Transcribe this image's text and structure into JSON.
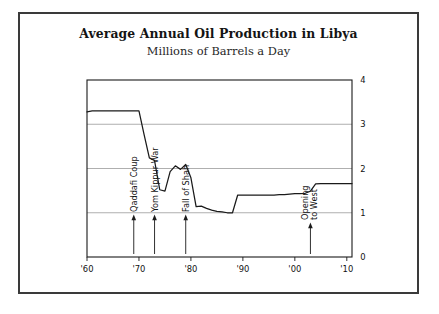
{
  "figure": {
    "title": "Average Annual Oil Production in Libya",
    "subtitle": "Millions of Barrels a Day"
  },
  "chart_data": {
    "type": "line",
    "title": "Average Annual Oil Production in Libya",
    "subtitle": "Millions of Barrels a Day",
    "xlabel": "",
    "ylabel": "Millions of Barrels a Day",
    "xlim": [
      1960,
      2011
    ],
    "ylim": [
      0,
      4
    ],
    "yticks": [
      0,
      1,
      2,
      3,
      4
    ],
    "ytick_labels": [
      "0",
      "1",
      "2",
      "3",
      "4"
    ],
    "ytick_side": "right",
    "xticks": [
      1960,
      1970,
      1980,
      1990,
      2000,
      2010
    ],
    "xtick_labels": [
      "'60",
      "'70",
      "'80",
      "'90",
      "'00",
      "'10"
    ],
    "grid": "horizontal",
    "legend": "none",
    "line_color": "#1a1a1a",
    "grid_color": "#9a9a9a",
    "axis_color": "#1a1a1a",
    "x": [
      1960,
      1961,
      1962,
      1963,
      1964,
      1965,
      1966,
      1967,
      1968,
      1969,
      1970,
      1971,
      1972,
      1973,
      1974,
      1975,
      1976,
      1977,
      1978,
      1979,
      1980,
      1981,
      1982,
      1983,
      1984,
      1985,
      1986,
      1987,
      1988,
      1989,
      1990,
      1991,
      1992,
      1993,
      1994,
      1995,
      1996,
      1997,
      1998,
      1999,
      2000,
      2001,
      2002,
      2003,
      2004,
      2005,
      2006,
      2007,
      2008,
      2009,
      2010,
      2011
    ],
    "values": [
      3.28,
      3.3,
      3.3,
      3.3,
      3.3,
      3.3,
      3.3,
      3.3,
      3.3,
      3.3,
      3.3,
      2.76,
      2.24,
      2.18,
      1.52,
      1.49,
      1.93,
      2.06,
      1.98,
      2.09,
      1.79,
      1.14,
      1.15,
      1.1,
      1.06,
      1.03,
      1.02,
      1.0,
      1.0,
      1.4,
      1.4,
      1.4,
      1.4,
      1.4,
      1.4,
      1.4,
      1.4,
      1.41,
      1.41,
      1.42,
      1.43,
      1.43,
      1.44,
      1.49,
      1.65,
      1.66,
      1.66,
      1.66,
      1.66,
      1.66,
      1.66,
      1.66
    ],
    "annotations": [
      {
        "label": "Qaddafi Coup",
        "year": 1969,
        "orientation": "vertical",
        "lines": [
          "Qaddafi Coup"
        ],
        "arrow": "up"
      },
      {
        "label": "Yom Kippur War",
        "year": 1973,
        "orientation": "vertical",
        "lines": [
          "Yom Kippur War"
        ],
        "arrow": "up"
      },
      {
        "label": "Fall of Shah",
        "year": 1979,
        "orientation": "vertical",
        "lines": [
          "Fall of Shah"
        ],
        "arrow": "up"
      },
      {
        "label": "Opening to West",
        "year": 2003,
        "orientation": "vertical",
        "lines": [
          "Opening",
          "to West"
        ],
        "arrow": "up"
      }
    ]
  }
}
